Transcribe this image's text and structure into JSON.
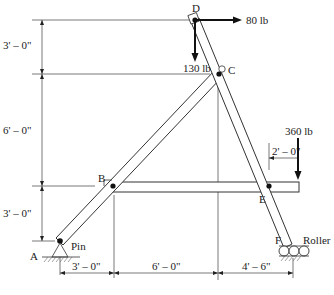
{
  "diagram": {
    "type": "frame-structure",
    "joints": {
      "A": {
        "label": "A",
        "support": "Pin",
        "support_label": "Pin"
      },
      "B": {
        "label": "B"
      },
      "C": {
        "label": "C"
      },
      "D": {
        "label": "D"
      },
      "E": {
        "label": "E"
      },
      "F": {
        "label": "F",
        "support": "Roller",
        "support_label": "Roller"
      }
    },
    "loads": [
      {
        "id": "load-d-horizontal",
        "label": "80 lb",
        "at": "D",
        "direction": "right"
      },
      {
        "id": "load-d-vertical",
        "label": "130 lb",
        "at": "D",
        "direction": "down"
      },
      {
        "id": "load-beam-end",
        "label": "360 lb",
        "at": "beam right end",
        "direction": "down"
      }
    ],
    "dimensions": {
      "vertical": [
        "3' – 0\"",
        "6' – 0\"",
        "3' – 0\""
      ],
      "horizontal": [
        "3' – 0\"",
        "6' – 0\"",
        "4' – 6\""
      ],
      "overhang": "2' – 0\""
    },
    "colors": {
      "line": "#333333",
      "force": "#111111",
      "background": "#ffffff"
    }
  }
}
